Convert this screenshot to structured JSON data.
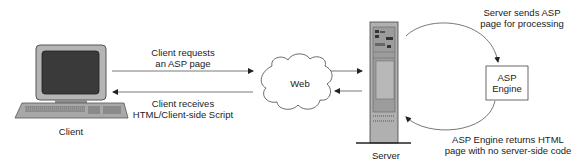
{
  "diagram": {
    "nodes": {
      "client": {
        "label": "Client"
      },
      "web": {
        "label": "Web"
      },
      "server": {
        "label": "Server"
      },
      "asp_engine": {
        "label_line1": "ASP",
        "label_line2": "Engine"
      }
    },
    "edges": {
      "request": {
        "line1": "Client requests",
        "line2": "an ASP page"
      },
      "response": {
        "line1": "Client receives",
        "line2": "HTML/Client-side Script"
      },
      "to_engine": {
        "line1": "Server sends ASP",
        "line2": "page for processing"
      },
      "from_engine": {
        "line1": "ASP Engine returns HTML",
        "line2": "page with no server-side code"
      }
    },
    "colors": {
      "line": "#555555",
      "text": "#222222",
      "device_gray": "#9a9a9a",
      "screen": "#3a3a3a"
    }
  }
}
